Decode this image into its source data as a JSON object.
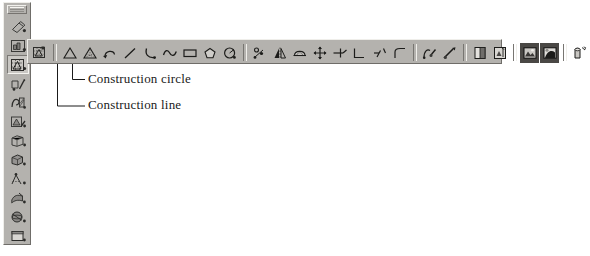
{
  "app": {
    "kind": "cad-drawing-toolbars",
    "background_color": "#ffffff",
    "toolbar_face_color": "#b4b2ae",
    "toolbar_highlight_color": "#efeeea",
    "toolbar_shadow_color": "#6f6d69",
    "icon_ink_color": "#3a3a38"
  },
  "vertical_toolbar": {
    "name": "main-draw-toolbar",
    "has_drag_grip": true,
    "selected_index": 2,
    "items": [
      {
        "icon": "eraser-icon",
        "label": "Erase"
      },
      {
        "icon": "insert-block-icon",
        "label": "Insert block"
      },
      {
        "icon": "construction-tools-icon",
        "label": "Construction tools"
      },
      {
        "icon": "edit-polyline-icon",
        "label": "Edit polyline"
      },
      {
        "icon": "hatch-icon",
        "label": "Hatch"
      },
      {
        "icon": "modify-object-icon",
        "label": "Modify object"
      },
      {
        "icon": "render-view-icon",
        "label": "Render view"
      },
      {
        "icon": "shade-icon",
        "label": "Shade"
      },
      {
        "icon": "dimension-icon",
        "label": "Dimension"
      },
      {
        "icon": "surfaces-icon",
        "label": "Surfaces"
      },
      {
        "icon": "solids-icon",
        "label": "Solids"
      },
      {
        "icon": "viewport-icon",
        "label": "Viewport"
      }
    ]
  },
  "horizontal_toolbar": {
    "name": "construction-flyout-toolbar",
    "items": [
      {
        "icon": "flyout-handle-icon",
        "label": "Flyout handle",
        "group": 0,
        "style": "plain"
      },
      {
        "icon": "separator",
        "label": "",
        "group": 0,
        "style": "separator"
      },
      {
        "icon": "construction-line-icon",
        "label": "Construction line",
        "group": 1,
        "style": "plain"
      },
      {
        "icon": "construction-circle-icon",
        "label": "Construction circle",
        "group": 1,
        "style": "plain"
      },
      {
        "icon": "polyline-arrow-icon",
        "label": "Polyline",
        "group": 1,
        "style": "plain"
      },
      {
        "icon": "line-icon",
        "label": "Line",
        "group": 1,
        "style": "plain"
      },
      {
        "icon": "arc-icon",
        "label": "Arc",
        "group": 1,
        "style": "plain"
      },
      {
        "icon": "spline-icon",
        "label": "Spline",
        "group": 1,
        "style": "plain"
      },
      {
        "icon": "rectangle-icon",
        "label": "Rectangle",
        "group": 1,
        "style": "plain"
      },
      {
        "icon": "polygon-icon",
        "label": "Polygon",
        "group": 1,
        "style": "plain"
      },
      {
        "icon": "circle-icon",
        "label": "Circle",
        "group": 1,
        "style": "plain"
      },
      {
        "icon": "separator",
        "label": "",
        "group": 1,
        "style": "separator"
      },
      {
        "icon": "point-array-icon",
        "label": "Point",
        "group": 2,
        "style": "plain"
      },
      {
        "icon": "mirror-icon",
        "label": "Mirror",
        "group": 2,
        "style": "plain"
      },
      {
        "icon": "dome-icon",
        "label": "Dome",
        "group": 2,
        "style": "plain"
      },
      {
        "icon": "move-icon",
        "label": "Move",
        "group": 2,
        "style": "plain"
      },
      {
        "icon": "trim-icon",
        "label": "Trim",
        "group": 2,
        "style": "plain"
      },
      {
        "icon": "extend-icon",
        "label": "Extend",
        "group": 2,
        "style": "plain"
      },
      {
        "icon": "break-icon",
        "label": "Break",
        "group": 2,
        "style": "plain"
      },
      {
        "icon": "fillet-icon",
        "label": "Fillet",
        "group": 2,
        "style": "plain"
      },
      {
        "icon": "separator",
        "label": "",
        "group": 2,
        "style": "separator"
      },
      {
        "icon": "edit-hatch-icon",
        "label": "Edit hatch",
        "group": 3,
        "style": "plain"
      },
      {
        "icon": "edit-spline-icon",
        "label": "Edit spline",
        "group": 3,
        "style": "plain"
      },
      {
        "icon": "separator",
        "label": "",
        "group": 3,
        "style": "separator"
      },
      {
        "icon": "viewport-split-icon",
        "label": "Viewport",
        "group": 4,
        "style": "plain"
      },
      {
        "icon": "named-views-icon",
        "label": "Named views",
        "group": 4,
        "style": "plain"
      },
      {
        "icon": "separator",
        "label": "",
        "group": 4,
        "style": "separator"
      },
      {
        "icon": "raster-image-icon",
        "label": "Raster image",
        "group": 5,
        "style": "dark"
      },
      {
        "icon": "image-adjust-icon",
        "label": "Image adjust",
        "group": 5,
        "style": "dark"
      },
      {
        "icon": "separator",
        "label": "",
        "group": 5,
        "style": "separator"
      },
      {
        "icon": "render-preview-icon",
        "label": "Render preview",
        "group": 6,
        "style": "plain"
      }
    ]
  },
  "annotations": {
    "construction_circle": {
      "text": "Construction circle",
      "leader": "L-shaped leader from the construction-circle toolbar button"
    },
    "construction_line": {
      "text": "Construction line",
      "leader": "L-shaped leader from the construction-line toolbar button"
    }
  }
}
